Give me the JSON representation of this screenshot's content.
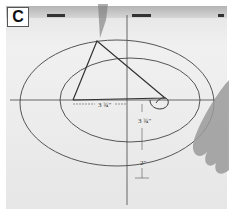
{
  "figure": {
    "panel_label": "C",
    "dimensions": {
      "horizontal": "3 ¾\"",
      "vertical_upper": "3 ¾\"",
      "vertical_lower": "2\""
    }
  }
}
